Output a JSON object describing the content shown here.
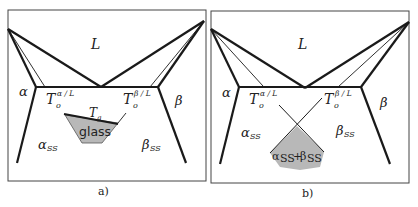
{
  "figure": {
    "panels": [
      {
        "id": "a",
        "caption": "a)",
        "labels": {
          "liquid": "L",
          "alpha": "α",
          "beta": "β",
          "alpha_ss": "α",
          "alpha_ss_sub": "SS",
          "beta_ss": "β",
          "beta_ss_sub": "SS",
          "t0_alpha": "T",
          "t0_alpha_sub": "o",
          "t0_alpha_sup": "α / L",
          "t0_beta": "T",
          "t0_beta_sub": "o",
          "t0_beta_sup": "β / L",
          "tg": "T",
          "tg_sub": "g",
          "region": "glass"
        }
      },
      {
        "id": "b",
        "caption": "b)",
        "labels": {
          "liquid": "L",
          "alpha": "α",
          "beta": "β",
          "alpha_ss": "α",
          "alpha_ss_sub": "SS",
          "beta_ss": "β",
          "beta_ss_sub": "SS",
          "t0_alpha": "T",
          "t0_alpha_sub": "o",
          "t0_alpha_sup": "α / L",
          "t0_beta": "T",
          "t0_beta_sub": "o",
          "t0_beta_sup": "β / L",
          "region_a": "α",
          "region_a_sub": "SS",
          "region_plus": "+",
          "region_b": "β",
          "region_b_sub": "SS"
        }
      }
    ],
    "colors": {
      "line": "#1a1a1a",
      "frame": "#444444",
      "fill": "#b8b8b8"
    }
  }
}
